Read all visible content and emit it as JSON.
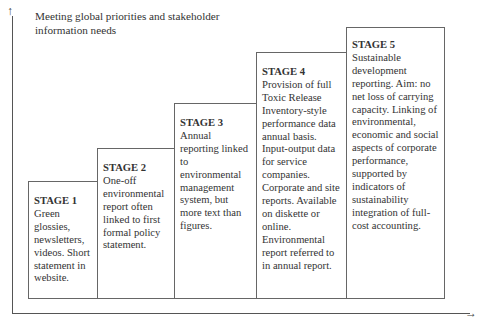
{
  "title": "Meeting global priorities and stakeholder information needs",
  "axes": {
    "y_arrow": "↑",
    "x_arrow": "→"
  },
  "stages": [
    {
      "label": "STAGE 1",
      "text": "Green glossies, newsletters, videos. Short statement in website."
    },
    {
      "label": "STAGE 2",
      "text": "One-off environmental report often linked to first formal policy statement."
    },
    {
      "label": "STAGE 3",
      "text": "Annual reporting linked to environmental management system, but more text than figures."
    },
    {
      "label": "STAGE 4",
      "text": "Provision of full Toxic Release Inventory-style performance data annual basis. Input-output data for service companies. Corporate and site reports. Available on diskette or online. Environmental report referred to in annual report."
    },
    {
      "label": "STAGE 5",
      "text": "Sustainable development reporting. Aim: no net loss of carrying capacity. Linking of environmental, economic and social aspects of corporate performance, supported by indicators of sustainability integration of full-cost accounting."
    }
  ]
}
